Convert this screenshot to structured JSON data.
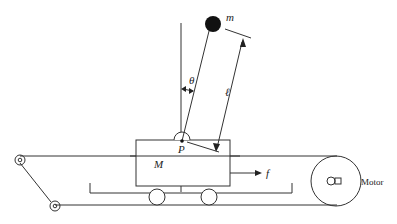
{
  "diagram": {
    "type": "cart-pole (inverted pendulum on belt-driven cart)",
    "labels": {
      "mass_bob": "m",
      "angle": "θ",
      "pivot": "P",
      "length": "ℓ",
      "cart_mass": "M",
      "force": "f",
      "motor": "Motor"
    },
    "colors": {
      "stroke": "#333333",
      "bob_fill": "#111111",
      "background": "#ffffff"
    }
  }
}
